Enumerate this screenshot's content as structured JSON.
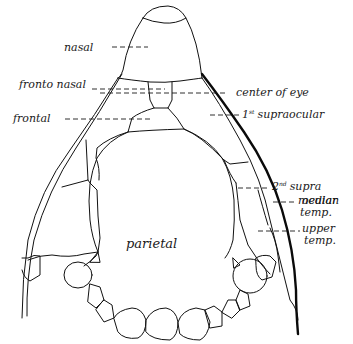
{
  "diagram": {
    "labels": {
      "nasal": "nasal",
      "fronto_nasal": "fronto nasal",
      "frontal": "frontal",
      "center_of_eye": "center of eye",
      "first_supraocular_num": "1",
      "first_supraocular_sup": "st",
      "first_supraocular_text": "supraocular",
      "second_supraocular_num": "2",
      "second_supraocular_sup": "nd",
      "second_supraocular_line1": "supra",
      "second_supraocular_line2": "ocular",
      "median_temp_line1": "median",
      "median_temp_line2": "temp.",
      "upper_temp_line1": "upper",
      "upper_temp_line2": "temp.",
      "parietal": "parietal"
    },
    "colors": {
      "ink": "#111111",
      "background": "#ffffff"
    }
  }
}
